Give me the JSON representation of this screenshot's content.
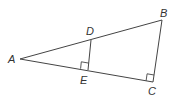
{
  "diagram": {
    "type": "geometry",
    "stroke_color": "#444444",
    "points": {
      "A": {
        "label": "A",
        "x": 20,
        "y": 59
      },
      "B": {
        "label": "B",
        "x": 162,
        "y": 20
      },
      "C": {
        "label": "C",
        "x": 153,
        "y": 82
      },
      "D": {
        "label": "D",
        "x": 91,
        "y": 40
      },
      "E": {
        "label": "E",
        "x": 88,
        "y": 70
      }
    },
    "segments": [
      "AB",
      "AC",
      "BC",
      "DE"
    ],
    "right_angles": [
      "DEA",
      "BCA"
    ],
    "labels": {
      "A": "A",
      "B": "B",
      "C": "C",
      "D": "D",
      "E": "E"
    }
  }
}
